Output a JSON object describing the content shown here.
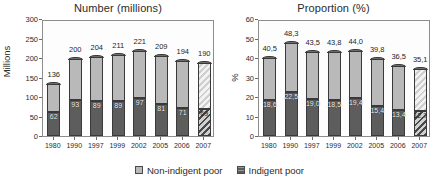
{
  "legend": {
    "items": [
      {
        "label": "Non-indigent poor",
        "swatch": "light",
        "color": "#b9b9b9"
      },
      {
        "label": "Indigent poor",
        "swatch": "dark",
        "color": "#5d5d5d"
      }
    ]
  },
  "chart_data": [
    {
      "type": "bar",
      "subtype": "stacked",
      "title": "Number (millions)",
      "xlabel": "",
      "ylabel": "Millions",
      "ylim": [
        0,
        300
      ],
      "yticks": [
        0,
        50,
        100,
        150,
        200,
        250,
        300
      ],
      "grid": false,
      "legend_position": "bottom-center",
      "categories": [
        "1980",
        "1990",
        "1997",
        "1999",
        "2002",
        "2005",
        "2006",
        "2007"
      ],
      "series": [
        {
          "name": "Indigent poor",
          "values": [
            62,
            93,
            89,
            89,
            97,
            81,
            71,
            69
          ]
        },
        {
          "name": "Non-indigent poor",
          "values": [
            74,
            107,
            115,
            122,
            124,
            128,
            123,
            121
          ]
        }
      ],
      "totals": [
        136,
        200,
        204,
        211,
        221,
        209,
        194,
        190
      ],
      "total_labels": [
        "136",
        "200",
        "204",
        "211",
        "221",
        "209",
        "194",
        "190"
      ],
      "inner_labels": [
        "62",
        "93",
        "89",
        "89",
        "97",
        "81",
        "71",
        "69"
      ],
      "hatched_categories": [
        "2007"
      ],
      "notes": "Last bar (2007) drawn with diagonal hatching to denote a projection"
    },
    {
      "type": "bar",
      "subtype": "stacked",
      "title": "Proportion (%)",
      "xlabel": "",
      "ylabel": "%",
      "ylim": [
        0,
        60
      ],
      "yticks": [
        0,
        10,
        20,
        30,
        40,
        50,
        60
      ],
      "grid": false,
      "legend_position": "bottom-center",
      "categories": [
        "1980",
        "1990",
        "1997",
        "1999",
        "2002",
        "2005",
        "2006",
        "2007"
      ],
      "series": [
        {
          "name": "Indigent poor",
          "values": [
            18.6,
            22.5,
            19.0,
            18.5,
            19.4,
            15.4,
            13.4,
            12.7
          ]
        },
        {
          "name": "Non-indigent poor",
          "values": [
            21.9,
            25.8,
            24.5,
            25.3,
            24.6,
            24.4,
            23.1,
            22.4
          ]
        }
      ],
      "totals": [
        40.5,
        48.3,
        43.5,
        43.8,
        44.0,
        39.8,
        36.5,
        35.1
      ],
      "total_labels": [
        "40,5",
        "48,3",
        "43,5",
        "43,8",
        "44,0",
        "39,8",
        "36,5",
        "35,1"
      ],
      "inner_labels": [
        "18,6",
        "22,5",
        "19,0",
        "18,5",
        "19,4",
        "15,4",
        "13,4",
        "12,7"
      ],
      "hatched_categories": [
        "2007"
      ],
      "notes": "Last bar (2007) drawn with diagonal hatching to denote a projection"
    }
  ]
}
